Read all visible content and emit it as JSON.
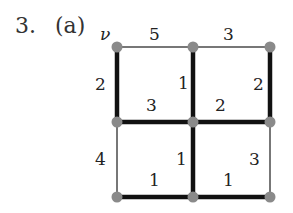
{
  "header": {
    "problem_number": "3.",
    "part_label": "(a)"
  },
  "graph": {
    "start_vertex_label": "ν",
    "nodes": [
      {
        "id": "v",
        "x": 117,
        "y": 47
      },
      {
        "id": "n2",
        "x": 193,
        "y": 47
      },
      {
        "id": "n3",
        "x": 270,
        "y": 47
      },
      {
        "id": "n4",
        "x": 117,
        "y": 122
      },
      {
        "id": "n5",
        "x": 193,
        "y": 122
      },
      {
        "id": "n6",
        "x": 270,
        "y": 122
      },
      {
        "id": "n7",
        "x": 117,
        "y": 197
      },
      {
        "id": "n8",
        "x": 193,
        "y": 197
      },
      {
        "id": "n9",
        "x": 270,
        "y": 197
      }
    ],
    "edges": [
      {
        "from": "v",
        "to": "n2",
        "weight": "5",
        "bold": false
      },
      {
        "from": "n2",
        "to": "n3",
        "weight": "3",
        "bold": false
      },
      {
        "from": "v",
        "to": "n4",
        "weight": "2",
        "bold": true
      },
      {
        "from": "n2",
        "to": "n5",
        "weight": "1",
        "bold": true
      },
      {
        "from": "n3",
        "to": "n6",
        "weight": "2",
        "bold": true
      },
      {
        "from": "n4",
        "to": "n5",
        "weight": "3",
        "bold": true
      },
      {
        "from": "n5",
        "to": "n6",
        "weight": "2",
        "bold": true
      },
      {
        "from": "n4",
        "to": "n7",
        "weight": "4",
        "bold": false
      },
      {
        "from": "n5",
        "to": "n8",
        "weight": "1",
        "bold": true
      },
      {
        "from": "n6",
        "to": "n9",
        "weight": "3",
        "bold": false
      },
      {
        "from": "n7",
        "to": "n8",
        "weight": "1",
        "bold": true
      },
      {
        "from": "n8",
        "to": "n9",
        "weight": "1",
        "bold": true
      }
    ],
    "colors": {
      "bold_edge": "#111111",
      "thin_edge": "#777777",
      "node": "#8a8a8a"
    }
  }
}
